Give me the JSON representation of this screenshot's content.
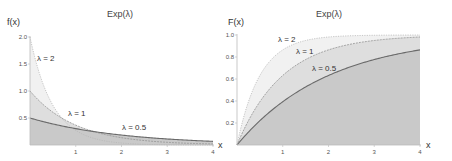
{
  "colors": {
    "fill_lambda_0_5": "#c9c9c9",
    "fill_lambda_1": "#dedede",
    "fill_lambda_2": "#f1f1f1",
    "line_lambda_0_5": "#6a6a6a",
    "line_lambda_1": "#9a9a9a",
    "line_lambda_2": "#b8b8b8"
  },
  "chart_data": [
    {
      "type": "area",
      "title": "Exp(λ)",
      "subtitle": "probability density function",
      "xlabel": "x",
      "ylabel": "f(x)",
      "xlim": [
        0,
        4
      ],
      "ylim": [
        0,
        2.0
      ],
      "x_ticks": [
        "1",
        "2",
        "3",
        "4"
      ],
      "y_ticks": [
        "0.5",
        "1.0",
        "1.5",
        "2.0"
      ],
      "grid": false,
      "formula": "f(x) = λ·e^(−λx)",
      "series": [
        {
          "name": "λ = 2",
          "lambda": 2,
          "label_pos": [
            37,
            61
          ],
          "x": [
            0,
            0.5,
            1,
            1.5,
            2,
            2.5,
            3,
            3.5,
            4
          ],
          "values": [
            2.0,
            0.736,
            0.271,
            0.1,
            0.037,
            0.013,
            0.005,
            0.002,
            0.001
          ]
        },
        {
          "name": "λ = 1",
          "lambda": 1,
          "label_pos": [
            68,
            116
          ],
          "x": [
            0,
            0.5,
            1,
            1.5,
            2,
            2.5,
            3,
            3.5,
            4
          ],
          "values": [
            1.0,
            0.607,
            0.368,
            0.223,
            0.135,
            0.082,
            0.05,
            0.03,
            0.018
          ]
        },
        {
          "name": "λ = 0.5",
          "lambda": 0.5,
          "label_pos": [
            122,
            130
          ],
          "x": [
            0,
            0.5,
            1,
            1.5,
            2,
            2.5,
            3,
            3.5,
            4
          ],
          "values": [
            0.5,
            0.389,
            0.303,
            0.236,
            0.184,
            0.143,
            0.112,
            0.087,
            0.068
          ]
        }
      ]
    },
    {
      "type": "area",
      "title": "Exp(λ)",
      "subtitle": "cumulative distribution function",
      "xlabel": "x",
      "ylabel": "F(x)",
      "xlim": [
        0,
        4
      ],
      "ylim": [
        0,
        1.0
      ],
      "x_ticks": [
        "1",
        "2",
        "3",
        "4"
      ],
      "y_ticks": [
        "0.2",
        "0.4",
        "0.6",
        "0.8",
        "1.0"
      ],
      "grid": false,
      "formula": "F(x) = 1 − e^(−λx)",
      "series": [
        {
          "name": "λ = 2",
          "lambda": 2,
          "label_pos": [
            278,
            42
          ],
          "x": [
            0,
            0.5,
            1,
            1.5,
            2,
            2.5,
            3,
            3.5,
            4
          ],
          "values": [
            0,
            0.632,
            0.865,
            0.95,
            0.982,
            0.993,
            0.998,
            0.999,
            1.0
          ]
        },
        {
          "name": "λ = 1",
          "lambda": 1,
          "label_pos": [
            296,
            54
          ],
          "x": [
            0,
            0.5,
            1,
            1.5,
            2,
            2.5,
            3,
            3.5,
            4
          ],
          "values": [
            0,
            0.393,
            0.632,
            0.777,
            0.865,
            0.918,
            0.95,
            0.97,
            0.982
          ]
        },
        {
          "name": "λ = 0.5",
          "lambda": 0.5,
          "label_pos": [
            312,
            71
          ],
          "x": [
            0,
            0.5,
            1,
            1.5,
            2,
            2.5,
            3,
            3.5,
            4
          ],
          "values": [
            0,
            0.221,
            0.393,
            0.528,
            0.632,
            0.713,
            0.777,
            0.826,
            0.865
          ]
        }
      ]
    }
  ]
}
